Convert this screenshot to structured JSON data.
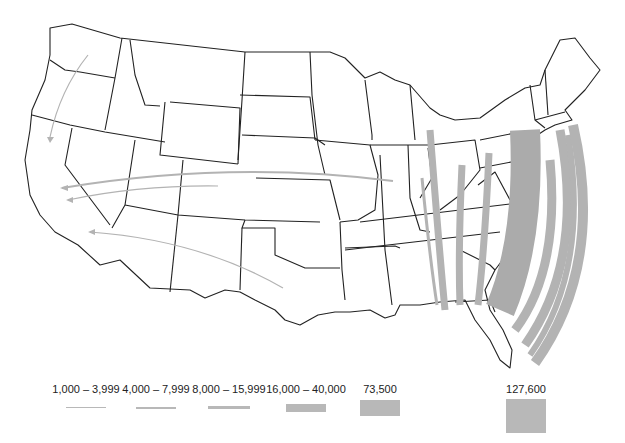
{
  "map": {
    "region": "Contiguous United States",
    "boundaries": "state outlines",
    "flow_color": "#b3b3b3",
    "outline_color": "#222222"
  },
  "flows": [
    {
      "from": "Washington",
      "to": "California",
      "class": "1,000 – 3,999"
    },
    {
      "from": "Illinois",
      "to": "California",
      "class": "4,000 – 7,999"
    },
    {
      "from": "Colorado",
      "to": "California",
      "class": "1,000 – 3,999"
    },
    {
      "from": "Texas",
      "to": "California",
      "class": "1,000 – 3,999"
    },
    {
      "from": "Michigan",
      "to": "Florida",
      "class": "8,000 – 15,999"
    },
    {
      "from": "Indiana",
      "to": "Florida",
      "class": "4,000 – 7,999"
    },
    {
      "from": "Ohio",
      "to": "Florida",
      "class": "8,000 – 15,999"
    },
    {
      "from": "West Virginia",
      "to": "Florida",
      "class": "8,000 – 15,999"
    },
    {
      "from": "Pennsylvania",
      "to": "Florida",
      "class": "73,500"
    },
    {
      "from": "New Jersey",
      "to": "Florida",
      "class": "16,000 – 40,000"
    },
    {
      "from": "New York",
      "to": "Florida",
      "class": "127,600"
    },
    {
      "from": "Connecticut",
      "to": "Florida",
      "class": "8,000 – 15,999"
    },
    {
      "from": "Massachusetts",
      "to": "Florida",
      "class": "16,000 – 40,000"
    }
  ],
  "legend": {
    "items": [
      {
        "label": "1,000 – 3,999"
      },
      {
        "label": "4,000 – 7,999"
      },
      {
        "label": "8,000 – 15,999"
      },
      {
        "label": "16,000 – 40,000"
      },
      {
        "label": "73,500"
      },
      {
        "label": "127,600"
      }
    ]
  }
}
